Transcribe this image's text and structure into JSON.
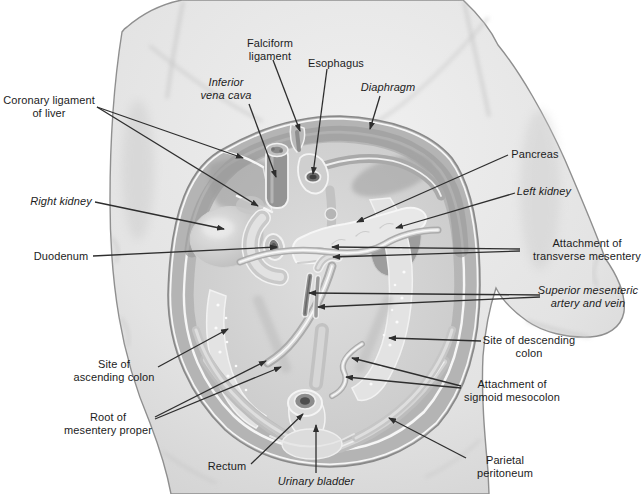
{
  "figure": {
    "type": "anatomical-diagram",
    "colors": {
      "background": "#ffffff",
      "body": "#e4e4e4",
      "cavity_wall": "#b4b4b4",
      "label_text": "#1c1c1c",
      "leader_line": "#2e2e2e"
    },
    "labels": [
      {
        "id": "falciform-ligament",
        "text_lines": [
          "Falciform",
          "ligament"
        ],
        "italic": false,
        "x": 270,
        "y": 37,
        "leaders": [
          [
            273,
            60,
            300,
            131
          ]
        ]
      },
      {
        "id": "esophagus",
        "text_lines": [
          "Esophagus"
        ],
        "italic": false,
        "x": 336,
        "y": 57,
        "leaders": [
          [
            327,
            69,
            313,
            174
          ]
        ]
      },
      {
        "id": "inferior-vena-cava",
        "text_lines": [
          "Inferior",
          "vena cava"
        ],
        "italic": true,
        "x": 226,
        "y": 76,
        "leaders": [
          [
            249,
            104,
            276,
            177
          ]
        ]
      },
      {
        "id": "diaphragm",
        "text_lines": [
          "Diaphragm"
        ],
        "italic": true,
        "x": 388,
        "y": 81,
        "leaders": [
          [
            380,
            96,
            370,
            129
          ]
        ]
      },
      {
        "id": "coronary-ligament-of-liver",
        "text_lines": [
          "Coronary ligament",
          "of liver"
        ],
        "italic": false,
        "x": 49,
        "y": 94,
        "leaders": [
          [
            97,
            107,
            243,
            158
          ],
          [
            97,
            107,
            258,
            206
          ]
        ]
      },
      {
        "id": "right-kidney",
        "text_lines": [
          "Right kidney"
        ],
        "italic": true,
        "x": 61,
        "y": 195,
        "leaders": [
          [
            95,
            202,
            224,
            229
          ]
        ]
      },
      {
        "id": "pancreas",
        "text_lines": [
          "Pancreas"
        ],
        "italic": false,
        "x": 535,
        "y": 148,
        "leaders": [
          [
            508,
            155,
            357,
            222
          ]
        ]
      },
      {
        "id": "left-kidney",
        "text_lines": [
          "Left kidney"
        ],
        "italic": true,
        "x": 544,
        "y": 185,
        "leaders": [
          [
            515,
            193,
            396,
            228
          ]
        ]
      },
      {
        "id": "attachment-of-transverse-mesentery",
        "text_lines": [
          "Attachment of",
          "transverse mesentery"
        ],
        "italic": false,
        "x": 587,
        "y": 237,
        "leaders": [
          [
            520,
            249,
            332,
            247
          ],
          [
            520,
            251,
            333,
            257
          ]
        ]
      },
      {
        "id": "duodenum",
        "text_lines": [
          "Duodenum"
        ],
        "italic": false,
        "x": 61,
        "y": 250,
        "leaders": [
          [
            93,
            256,
            277,
            247
          ]
        ]
      },
      {
        "id": "superior-mesenteric-artery-and-vein",
        "text_lines": [
          "Superior mesenteric",
          "artery and vein"
        ],
        "italic": true,
        "x": 588,
        "y": 284,
        "leaders": [
          [
            540,
            295,
            309,
            293
          ],
          [
            540,
            297,
            318,
            307
          ]
        ]
      },
      {
        "id": "site-of-descending-colon",
        "text_lines": [
          "Site of descending",
          "colon"
        ],
        "italic": false,
        "x": 529,
        "y": 334,
        "leaders": [
          [
            481,
            341,
            389,
            338
          ]
        ]
      },
      {
        "id": "site-of-ascending-colon",
        "text_lines": [
          "Site of",
          "ascending colon"
        ],
        "italic": false,
        "x": 114,
        "y": 358,
        "leaders": [
          [
            158,
            367,
            228,
            329
          ]
        ]
      },
      {
        "id": "attachment-of-sigmoid-mesocolon",
        "text_lines": [
          "Attachment of",
          "sigmoid mesocolon"
        ],
        "italic": false,
        "x": 512,
        "y": 378,
        "leaders": [
          [
            461,
            386,
            352,
            358
          ],
          [
            461,
            388,
            346,
            377
          ]
        ]
      },
      {
        "id": "root-of-mesentery-proper",
        "text_lines": [
          "Root of",
          "mesentery proper"
        ],
        "italic": false,
        "x": 108,
        "y": 411,
        "leaders": [
          [
            155,
            417,
            266,
            361
          ],
          [
            155,
            419,
            281,
            367
          ]
        ]
      },
      {
        "id": "rectum",
        "text_lines": [
          "Rectum"
        ],
        "italic": false,
        "x": 227,
        "y": 460,
        "leaders": [
          [
            251,
            464,
            303,
            414
          ]
        ]
      },
      {
        "id": "urinary-bladder",
        "text_lines": [
          "Urinary bladder"
        ],
        "italic": true,
        "x": 316,
        "y": 475,
        "leaders": [
          [
            316,
            473,
            316,
            425
          ]
        ]
      },
      {
        "id": "parietal-peritoneum",
        "text_lines": [
          "Parietal",
          "peritoneum"
        ],
        "italic": false,
        "x": 505,
        "y": 454,
        "leaders": [
          [
            466,
            458,
            389,
            418
          ]
        ]
      }
    ]
  }
}
